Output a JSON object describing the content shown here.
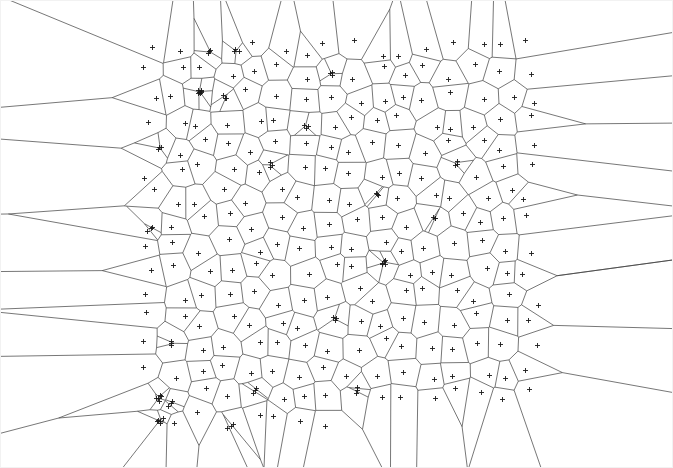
{
  "figure": {
    "title": "",
    "subtitle": "",
    "width": 673,
    "height": 468,
    "background_color": "#ffffff",
    "border_color": "#f2f2f2",
    "description": "Voronoi tessellation of a dense scattered point cloud with unbounded ridges radiating outward"
  },
  "chart_data": {
    "type": "scatter",
    "plot_kind": "voronoi-diagram",
    "title": "",
    "xlabel": "",
    "ylabel": "",
    "xlim": [
      0,
      673
    ],
    "ylim": [
      0,
      468
    ],
    "grid": false,
    "axes_visible": false,
    "tick_labels_visible": false,
    "legend": null,
    "point_cloud": {
      "marker": "+",
      "marker_color": "#1a1a1a",
      "marker_size_px": 5,
      "marker_line_width": 0.9,
      "n_points": 300,
      "x_range": [
        138,
        542
      ],
      "y_range": [
        34,
        432
      ],
      "distribution": "jittered-grid-with-clusters",
      "cluster_count": 26,
      "cluster_points_each": 3,
      "cluster_jitter_px": 3.5,
      "seed": 20240917
    },
    "ridges": {
      "line_color": "#3c3c3c",
      "line_width": 0.7,
      "finite_ridges_drawn": true,
      "infinite_ridges_drawn": true,
      "infinite_ridge_extension_px": 1400
    }
  }
}
